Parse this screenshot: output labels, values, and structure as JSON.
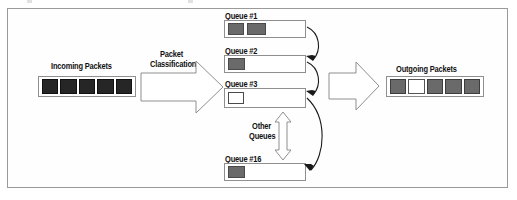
{
  "figure": {
    "background_color": "#ffffff",
    "frame_color": "#9a9a9a"
  },
  "colors": {
    "packet_dark": "#262626",
    "packet_gray": "#6a6a6a",
    "packet_empty": "#ffffff",
    "outline": "#8f8f8f",
    "text": "#111111"
  },
  "incoming": {
    "label": "Incoming Packets",
    "packets": [
      {
        "state": "dark"
      },
      {
        "state": "dark"
      },
      {
        "state": "dark"
      },
      {
        "state": "dark"
      },
      {
        "state": "dark"
      }
    ]
  },
  "classifier": {
    "label_line1": "Packet",
    "label_line2": "Classification",
    "icon": "right-block-arrow-icon"
  },
  "queues": [
    {
      "label": "Queue #1",
      "packets": [
        "gray",
        "gray"
      ]
    },
    {
      "label": "Queue #2",
      "packets": [
        "gray"
      ]
    },
    {
      "label": "Queue #3",
      "packets": [
        "empty"
      ]
    },
    {
      "label": "Queue #16",
      "packets": [
        "gray"
      ]
    }
  ],
  "other_queues": {
    "label_line1": "Other",
    "label_line2": "Queues",
    "icon": "vertical-double-arrow-icon"
  },
  "scheduler": {
    "icon": "right-block-arrow-icon",
    "service_arrows": [
      {
        "from": "Queue #1",
        "to": "Queue #2"
      },
      {
        "from": "Queue #2",
        "to": "Queue #3"
      },
      {
        "from": "Queue #3",
        "to": "Queue #16"
      }
    ]
  },
  "outgoing": {
    "label": "Outgoing Packets",
    "packets": [
      {
        "state": "gray"
      },
      {
        "state": "empty"
      },
      {
        "state": "gray"
      },
      {
        "state": "gray"
      },
      {
        "state": "gray"
      }
    ]
  }
}
